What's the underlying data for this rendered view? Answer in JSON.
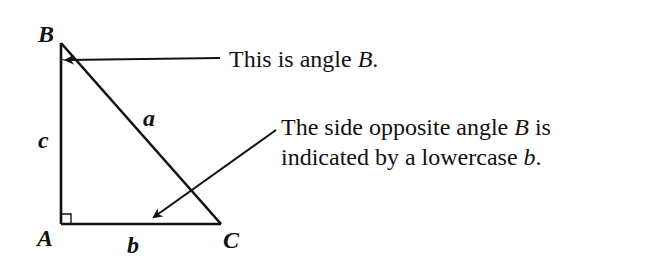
{
  "diagram": {
    "type": "right-triangle-annotation",
    "vertices": {
      "A": {
        "label": "A",
        "x": 61,
        "y": 224
      },
      "B": {
        "label": "B",
        "x": 61,
        "y": 43
      },
      "C": {
        "label": "C",
        "x": 220,
        "y": 224
      }
    },
    "sides": {
      "a": {
        "label": "a"
      },
      "b": {
        "label": "b"
      },
      "c": {
        "label": "c"
      }
    },
    "right_angle_at": "A",
    "angle_marked": "B",
    "annotations": [
      {
        "id": "angle-b-note",
        "text_prefix": "This is angle ",
        "text_italic": "B",
        "text_suffix": "."
      },
      {
        "id": "side-b-note",
        "line1_prefix": "The side opposite angle ",
        "line1_italic": "B",
        "line1_suffix": " is",
        "line2_prefix": "indicated by a lowercase ",
        "line2_italic": "b",
        "line2_suffix": "."
      }
    ],
    "colors": {
      "stroke": "#111111",
      "background": "#ffffff"
    }
  }
}
